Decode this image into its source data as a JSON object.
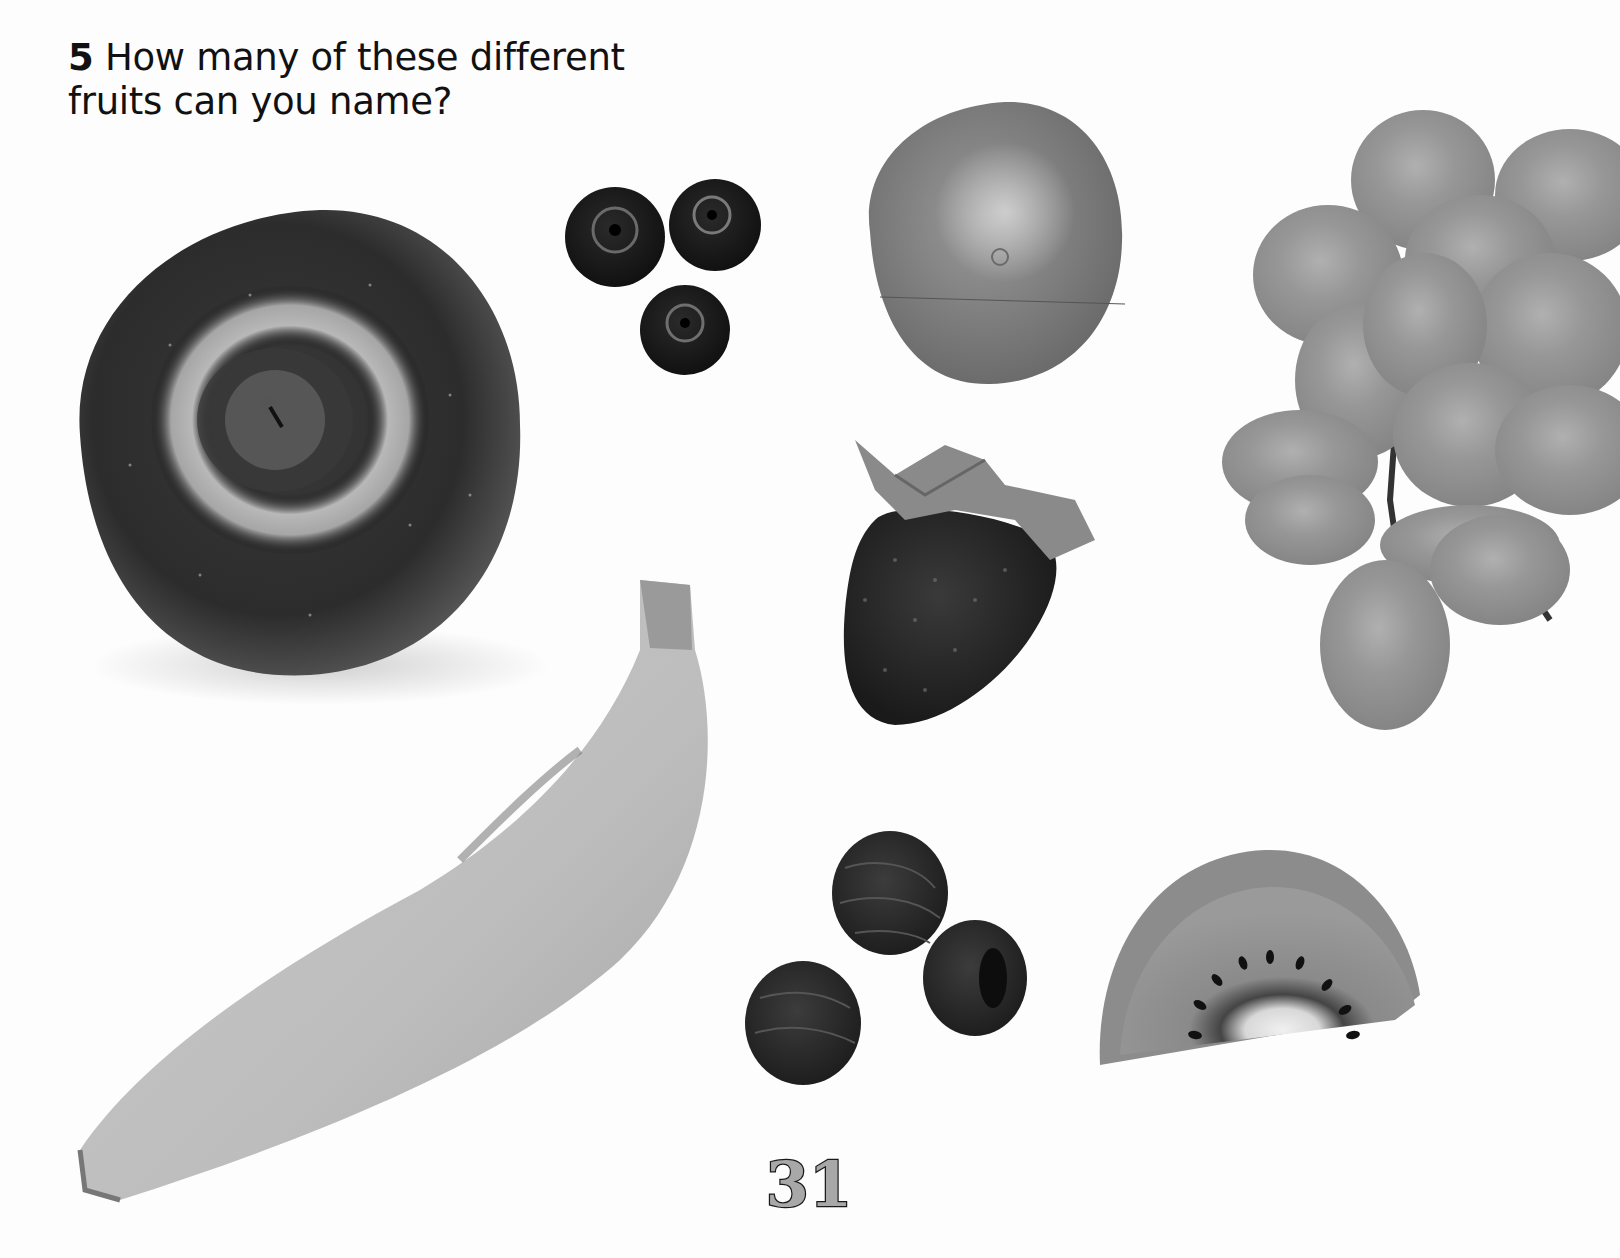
{
  "question": {
    "number": "5",
    "line1": "How many of these different",
    "line2": "fruits can you name?"
  },
  "fruits": [
    {
      "name": "apple",
      "label": "Apple"
    },
    {
      "name": "blueberries",
      "label": "Blueberries",
      "count": 3
    },
    {
      "name": "orange",
      "label": "Orange"
    },
    {
      "name": "grapes",
      "label": "Grapes"
    },
    {
      "name": "strawberry",
      "label": "Strawberry"
    },
    {
      "name": "banana",
      "label": "Banana"
    },
    {
      "name": "raspberries",
      "label": "Raspberries",
      "count": 3
    },
    {
      "name": "kiwi",
      "label": "Kiwi fruit"
    }
  ],
  "page_number": "31",
  "colors": {
    "background": "#fdfdfd",
    "text": "#111111",
    "page_number_fill": "#a8a8a8",
    "page_number_stroke": "#1a1a1a"
  }
}
